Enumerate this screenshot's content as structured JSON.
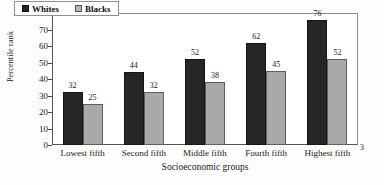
{
  "chart_data": {
    "type": "bar",
    "title": "",
    "categories": [
      "Lowest fifth",
      "Second fifth",
      "Middle fifth",
      "Fourth fifth",
      "Highest fifth"
    ],
    "series": [
      {
        "name": "Whites",
        "values": [
          32,
          44,
          52,
          62,
          76
        ],
        "color": "#262626"
      },
      {
        "name": "Blacks",
        "values": [
          25,
          32,
          38,
          45,
          52
        ],
        "color": "#a9a9a9"
      }
    ],
    "xlabel": "Socioeconomic groups",
    "ylabel": "Percentile rank",
    "ylim": [
      0,
      80
    ],
    "yticks": [
      0,
      10,
      20,
      30,
      40,
      50,
      60,
      70,
      80
    ],
    "ytick_labels": [
      "0",
      "10",
      "20",
      "30",
      "40",
      "50",
      "60",
      "70",
      "80"
    ],
    "grid": false,
    "legend_position": "top-left",
    "data_labels": true
  },
  "footnote_marker": "3"
}
